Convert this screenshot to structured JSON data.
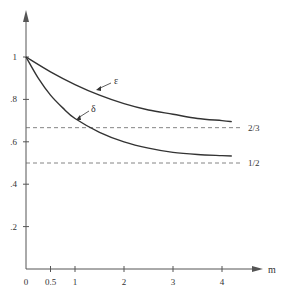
{
  "chart_data": {
    "type": "line",
    "title": "",
    "xlabel": "m",
    "ylabel": "",
    "xlim": [
      0,
      4.9
    ],
    "ylim": [
      0,
      1.1
    ],
    "x_ticks": [
      {
        "v": 0,
        "label": "0"
      },
      {
        "v": 0.5,
        "label": "0.5"
      },
      {
        "v": 1,
        "label": "1"
      },
      {
        "v": 2,
        "label": "2"
      },
      {
        "v": 3,
        "label": "3"
      },
      {
        "v": 4,
        "label": "4"
      }
    ],
    "y_ticks": [
      {
        "v": 0.2,
        "label": ".2"
      },
      {
        "v": 0.4,
        "label": ".4"
      },
      {
        "v": 0.6,
        "label": ".6"
      },
      {
        "v": 0.8,
        "label": ".8"
      },
      {
        "v": 1,
        "label": "1"
      }
    ],
    "series": [
      {
        "name": "ε",
        "x": [
          0,
          0.5,
          1,
          1.5,
          2,
          2.5,
          3,
          3.5,
          4,
          4.2
        ],
        "values": [
          1.0,
          0.93,
          0.87,
          0.82,
          0.78,
          0.75,
          0.73,
          0.71,
          0.7,
          0.695
        ]
      },
      {
        "name": "δ",
        "x": [
          0,
          0.25,
          0.5,
          0.75,
          1,
          1.5,
          2,
          2.5,
          3,
          3.5,
          4,
          4.2
        ],
        "values": [
          1.0,
          0.9,
          0.82,
          0.76,
          0.71,
          0.645,
          0.6,
          0.57,
          0.55,
          0.54,
          0.535,
          0.533
        ]
      }
    ],
    "reference_lines": [
      {
        "y": 0.6667,
        "label": "2/3",
        "style": "dashed"
      },
      {
        "y": 0.5,
        "label": "1/2",
        "style": "dashed"
      }
    ],
    "annotations": [
      {
        "text": "ε",
        "x": 1.9,
        "y": 0.865
      },
      {
        "text": "δ",
        "x": 1.15,
        "y": 0.82
      }
    ],
    "legend": "none",
    "grid": false
  }
}
